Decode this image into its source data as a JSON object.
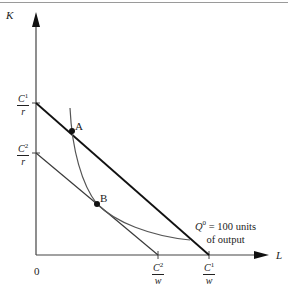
{
  "diagram": {
    "type": "isocost-isoquant",
    "axes": {
      "y_label": "K",
      "x_label": "L",
      "origin_label": "0"
    },
    "y_ticks": [
      {
        "id": "c1_r",
        "num_base": "C",
        "num_sup": "1",
        "den": "r"
      },
      {
        "id": "c2_r",
        "num_base": "C",
        "num_sup": "2",
        "den": "r"
      }
    ],
    "x_ticks": [
      {
        "id": "c2_w",
        "num_base": "C",
        "num_sup": "2",
        "den": "w"
      },
      {
        "id": "c1_w",
        "num_base": "C",
        "num_sup": "1",
        "den": "w"
      }
    ],
    "points": [
      {
        "id": "A",
        "label": "A"
      },
      {
        "id": "B",
        "label": "B"
      }
    ],
    "isoquant_label": {
      "q": "Q",
      "q_sup": "0",
      "text_line1": " = 100 units",
      "text_line2": "of output"
    },
    "lines": [
      {
        "name": "isocost-C1",
        "from": "C1/r",
        "to": "C1/w",
        "weight": "heavy"
      },
      {
        "name": "isocost-C2",
        "from": "C2/r",
        "to": "C2/w",
        "weight": "light"
      },
      {
        "name": "isoquant-Q0",
        "through": [
          "A",
          "B"
        ]
      }
    ]
  },
  "colors": {
    "heavy_line": "#111111",
    "light_line": "#3a3a3a",
    "isoquant": "#555555",
    "axis": "#444444",
    "text": "#222222"
  }
}
